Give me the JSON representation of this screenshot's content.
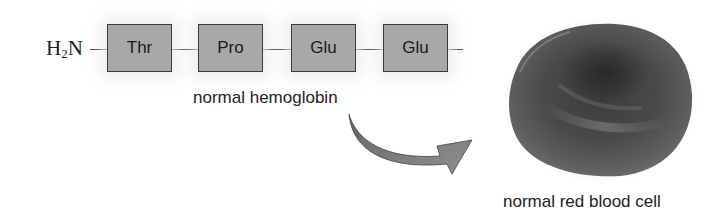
{
  "diagram": {
    "n_terminus": {
      "prefix": "H",
      "subscript": "2",
      "suffix": "N"
    },
    "residues": [
      {
        "label": "Thr"
      },
      {
        "label": "Pro"
      },
      {
        "label": "Glu"
      },
      {
        "label": "Glu"
      }
    ],
    "protein_label": "normal hemoglobin",
    "cell_label": "normal red blood cell",
    "colors": {
      "residue_fill": "#a8a8a8",
      "residue_border": "#3a3a3a",
      "arrow_fill": "#7d7d7d",
      "cell_dark": "#2e2e2e",
      "cell_mid": "#5a5a5a"
    }
  }
}
